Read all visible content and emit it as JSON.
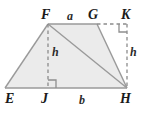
{
  "figure": {
    "type": "geometry-diagram",
    "colors": {
      "fill": "#ebebeb",
      "stroke": "#9a9a9a",
      "dashed": "#8c8c8c",
      "label": "#1a1a1a",
      "background": "#ffffff"
    },
    "vertices": [
      {
        "id": "E",
        "label": "E",
        "x": 5,
        "y": 88,
        "label_x": 5,
        "label_y": 92
      },
      {
        "id": "F",
        "label": "F",
        "x": 48,
        "y": 24,
        "label_x": 41,
        "label_y": 8
      },
      {
        "id": "G",
        "label": "G",
        "x": 97,
        "y": 24,
        "label_x": 88,
        "label_y": 8
      },
      {
        "id": "K",
        "label": "K",
        "x": 127,
        "y": 24,
        "label_x": 121,
        "label_y": 8
      },
      {
        "id": "H",
        "label": "H",
        "x": 127,
        "y": 88,
        "label_x": 120,
        "label_y": 92
      },
      {
        "id": "J",
        "label": "J",
        "x": 48,
        "y": 88,
        "label_x": 41,
        "label_y": 92
      }
    ],
    "segment_labels": [
      {
        "id": "a",
        "label": "a",
        "x": 67,
        "y": 10
      },
      {
        "id": "b",
        "label": "b",
        "x": 79,
        "y": 94
      },
      {
        "id": "h-left",
        "label": "h",
        "x": 52,
        "y": 46
      },
      {
        "id": "h-right",
        "label": "h",
        "x": 130,
        "y": 46
      }
    ],
    "solid_edges": [
      {
        "id": "edge-EF",
        "from": "E",
        "to": "F"
      },
      {
        "id": "edge-FG",
        "from": "F",
        "to": "G"
      },
      {
        "id": "edge-GH",
        "from": "G",
        "to": "H"
      },
      {
        "id": "edge-EH",
        "from": "E",
        "to": "H"
      },
      {
        "id": "edge-FH",
        "from": "F",
        "to": "H"
      }
    ],
    "dashed_edges": [
      {
        "id": "edge-FJ",
        "from": "F",
        "to": "J"
      },
      {
        "id": "edge-GK",
        "from": "G",
        "to": "K"
      },
      {
        "id": "edge-KH",
        "from": "K",
        "to": "H"
      }
    ],
    "right_angles": [
      {
        "id": "right-angle-J",
        "at": "J"
      },
      {
        "id": "right-angle-K",
        "at": "K"
      }
    ]
  }
}
